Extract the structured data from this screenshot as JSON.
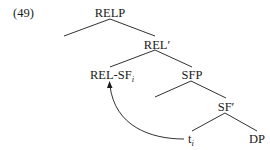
{
  "example_number": "(49)",
  "tree": {
    "nodes": {
      "relp": {
        "label": "RELP"
      },
      "rel_bar": {
        "label": "REL′"
      },
      "rel_sf": {
        "label": "REL-SF",
        "subscript": "i"
      },
      "sfp": {
        "label": "SFP"
      },
      "sf_bar": {
        "label": "SF′"
      },
      "trace": {
        "label": "t",
        "subscript": "i"
      },
      "dp": {
        "label": "DP"
      }
    },
    "edges": [
      [
        "RELP",
        "(empty specifier)"
      ],
      [
        "RELP",
        "REL′"
      ],
      [
        "REL′",
        "REL-SF_i"
      ],
      [
        "REL′",
        "SFP"
      ],
      [
        "SFP",
        "(empty specifier)"
      ],
      [
        "SFP",
        "SF′"
      ],
      [
        "SF′",
        "t_i"
      ],
      [
        "SF′",
        "DP"
      ]
    ],
    "movement_arrow": {
      "from": "t_i",
      "to": "REL-SF_i"
    }
  },
  "colors": {
    "ink": "#1a1a1a",
    "background": "#ffffff"
  }
}
